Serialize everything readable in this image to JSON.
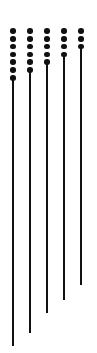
{
  "chart_data": {
    "type": "scatter",
    "title": "",
    "subtitle": "",
    "xlabel": "",
    "ylabel": "",
    "grid": false,
    "legend": null,
    "annotations": [],
    "xlim": [
      0,
      5
    ],
    "ylim": [
      0,
      353
    ],
    "axis_visible": false,
    "tick_labels_x": [],
    "tick_labels_y": [],
    "marker_color": "#111111",
    "line_color": "#111111",
    "background_color": "#ffffff",
    "marker_diameter": 5.6,
    "line_width": 2.2,
    "dot_spacing": 7.8,
    "categories": [
      "1",
      "2",
      "3",
      "4",
      "5"
    ],
    "series": [
      {
        "name": "stem-1",
        "x": 13,
        "dot_count": 7,
        "dot_start_y": 31,
        "line_top_y": 78,
        "line_bottom_y": 346,
        "line_length": 268
      },
      {
        "name": "stem-2",
        "x": 30,
        "dot_count": 6,
        "dot_start_y": 31,
        "line_top_y": 70,
        "line_bottom_y": 333,
        "line_length": 263
      },
      {
        "name": "stem-3",
        "x": 47,
        "dot_count": 5,
        "dot_start_y": 31,
        "line_top_y": 63,
        "line_bottom_y": 313,
        "line_length": 250
      },
      {
        "name": "stem-4",
        "x": 64,
        "dot_count": 4,
        "dot_start_y": 31,
        "line_top_y": 55,
        "line_bottom_y": 300,
        "line_length": 245
      },
      {
        "name": "stem-5",
        "x": 81,
        "dot_count": 3,
        "dot_start_y": 31,
        "line_top_y": 47,
        "line_bottom_y": 285,
        "line_length": 238
      }
    ],
    "values": [
      7,
      6,
      5,
      4,
      3
    ],
    "line_lengths": [
      268,
      263,
      250,
      245,
      238
    ]
  }
}
